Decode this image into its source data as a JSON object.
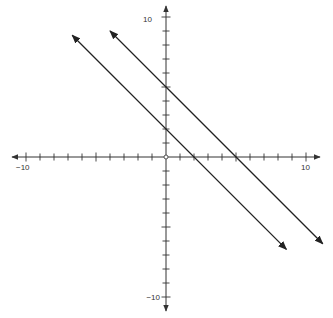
{
  "chart_data": {
    "type": "line",
    "title": "",
    "xlabel": "",
    "ylabel": "",
    "xlim": [
      -10,
      10
    ],
    "ylim": [
      -10,
      10
    ],
    "grid": false,
    "tick_step": 1,
    "tick_labels": {
      "x_min": "−10",
      "x_max": "10",
      "y_min": "−10",
      "y_max": "10"
    },
    "series": [
      {
        "name": "line-1",
        "equation": "y = -x + 2",
        "slope": -1,
        "intercept": 2,
        "x_range": [
          -6.7,
          8.6
        ],
        "arrows": "both"
      },
      {
        "name": "line-2",
        "equation": "y = -x + 5",
        "slope": -1,
        "intercept": 5,
        "x_range": [
          -4,
          11.2
        ],
        "arrows": "both"
      }
    ],
    "origin_marker": "open-circle",
    "colors": {
      "axis": "#333333",
      "line": "#222222"
    }
  }
}
